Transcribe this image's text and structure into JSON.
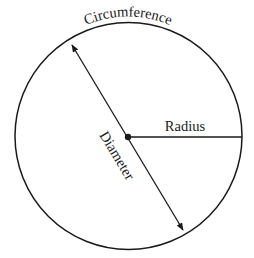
{
  "diagram": {
    "labels": {
      "circumference": "Circumference",
      "radius": "Radius",
      "diameter": "Diameter"
    },
    "geometry": {
      "center": [
        128,
        137
      ],
      "radius": 114,
      "diameter_start": [
        72,
        45
      ],
      "diameter_end": [
        183,
        230
      ],
      "radius_end": [
        242,
        137
      ]
    },
    "colors": {
      "stroke": "#1a1a1a",
      "background": "#ffffff"
    }
  }
}
